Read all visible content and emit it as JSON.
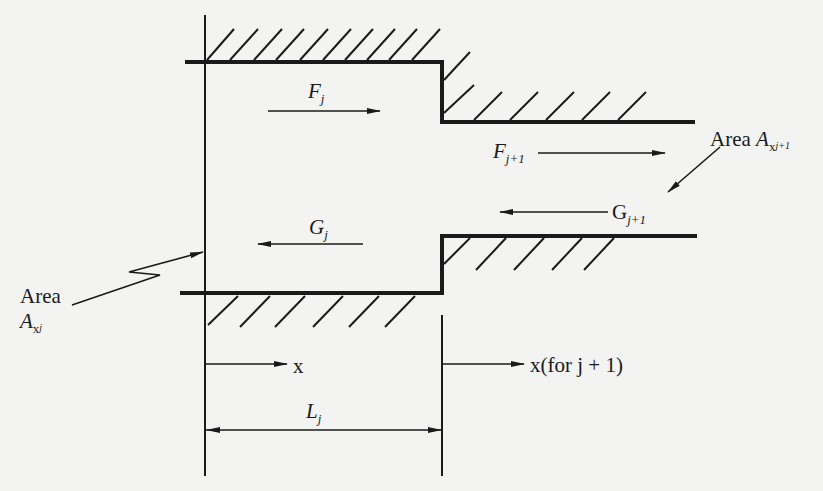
{
  "figure": {
    "labels": {
      "F_j": {
        "main": "F",
        "sub": "j"
      },
      "F_j1": {
        "main": "F",
        "sub": "j+1"
      },
      "G_j": {
        "main": "G",
        "sub": "j"
      },
      "G_j1": {
        "main": "G",
        "sub": "j+1"
      },
      "area_j": {
        "word": "Area",
        "main": "A",
        "sub": "x",
        "subsub": "j"
      },
      "area_j1": {
        "word": "Area",
        "main": "A",
        "sub": "x",
        "subsub": "j+1"
      },
      "x_axis": "x",
      "x_next": "x(for j + 1)",
      "L_j": {
        "main": "L",
        "sub": "j"
      }
    },
    "colors": {
      "ink": "#1a1a1a",
      "paper": "#f3f3f1"
    }
  }
}
